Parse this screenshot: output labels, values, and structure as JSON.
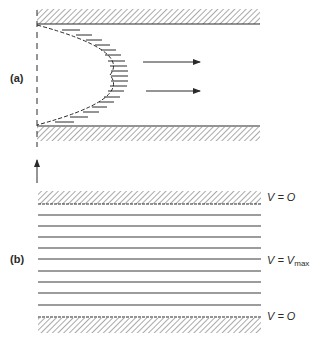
{
  "panels": {
    "a": {
      "label": "(a)",
      "description": "Parabolic velocity profile in pipe flow",
      "flow_arrows": 2
    },
    "b": {
      "label": "(b)",
      "description": "Laminar flow streamlines between walls",
      "labels": {
        "top": "V = O",
        "middle_prefix": "V = V",
        "middle_sub": "max",
        "bottom": "V = O"
      },
      "streamline_count": 9
    }
  },
  "colors": {
    "ink": "#2a2a2a",
    "background": "#ffffff"
  }
}
